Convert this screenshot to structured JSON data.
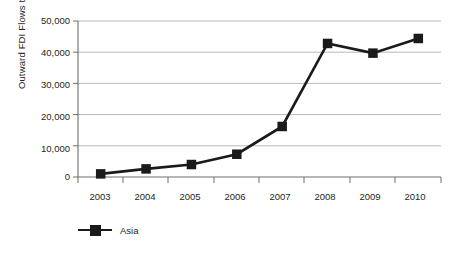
{
  "chart_data": {
    "type": "line",
    "title": "",
    "subtitle": "",
    "xlabel": "",
    "ylabel": "Outward FDI Flows to Asia",
    "categories": [
      "2003",
      "2004",
      "2005",
      "2006",
      "2007",
      "2008",
      "2009",
      "2010"
    ],
    "ytick_labels": [
      "50,000",
      "40,000",
      "30,000",
      "20,000",
      "10,000",
      "0"
    ],
    "ytick_values": [
      50000,
      40000,
      30000,
      20000,
      10000,
      0
    ],
    "ylim": [
      0,
      50000
    ],
    "grid": "horizontal",
    "legend_position": "bottom-left",
    "series": [
      {
        "name": "Asia",
        "color": "#1a1a1a",
        "marker": "square",
        "values": [
          1000,
          2600,
          4000,
          7300,
          16200,
          42800,
          39700,
          44400
        ]
      }
    ]
  },
  "legend": {
    "entries": [
      {
        "label": "Asia",
        "color": "#1a1a1a",
        "marker_icon": "square-marker-icon"
      }
    ]
  },
  "colors": {
    "series": "#1a1a1a",
    "axis": "#6f6f6f",
    "grid": "#b9b9b9",
    "text": "#231f20",
    "background": "#ffffff"
  }
}
